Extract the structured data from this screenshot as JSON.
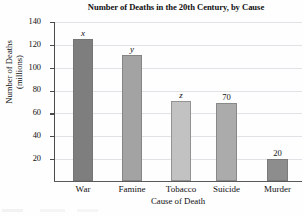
{
  "chart_data": {
    "type": "bar",
    "title": "Number of Deaths in the 20th Century, by Cause",
    "xlabel": "Cause of Death",
    "ylabel": "Number of Deaths",
    "ylabel_line2": "(millions)",
    "categories": [
      "War",
      "Famine",
      "Tobacco",
      "Suicide",
      "Murder"
    ],
    "values": [
      124,
      110,
      70,
      68,
      19
    ],
    "bar_labels": [
      "x",
      "y",
      "z",
      "70",
      "20"
    ],
    "bar_label_italic": [
      true,
      true,
      true,
      false,
      false
    ],
    "bar_colors": [
      "#7e7e7e",
      "#a3a3a3",
      "#c2c2c2",
      "#ababab",
      "#8d8d8d"
    ],
    "ylim": [
      0,
      140
    ],
    "yticks": [
      140,
      120,
      100,
      80,
      60,
      40,
      20
    ],
    "ytick_labels": [
      "140",
      "120",
      "100",
      "80",
      "60",
      "40",
      "20"
    ],
    "grid": true,
    "legend": "none"
  }
}
